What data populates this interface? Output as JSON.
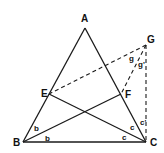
{
  "diagram": {
    "type": "geometry",
    "points": {
      "A": {
        "label": "A",
        "x": 85,
        "y": 28,
        "lx": 81,
        "ly": 22
      },
      "B": {
        "label": "B",
        "x": 23,
        "y": 142,
        "lx": 13,
        "ly": 146
      },
      "C": {
        "label": "C",
        "x": 146,
        "y": 142,
        "lx": 150,
        "ly": 146
      },
      "E": {
        "label": "E",
        "x": 49,
        "y": 94,
        "lx": 41,
        "ly": 97
      },
      "F": {
        "label": "F",
        "x": 121,
        "y": 94,
        "lx": 125,
        "ly": 98
      },
      "G": {
        "label": "G",
        "x": 146,
        "y": 45,
        "lx": 147,
        "ly": 43
      }
    },
    "solid_segments": [
      [
        "A",
        "B"
      ],
      [
        "A",
        "C"
      ],
      [
        "B",
        "C"
      ],
      [
        "B",
        "F"
      ],
      [
        "C",
        "E"
      ]
    ],
    "dashed_segments": [
      [
        "G",
        "E"
      ],
      [
        "G",
        "F"
      ],
      [
        "G",
        "C"
      ]
    ],
    "angle_labels": [
      {
        "text": "b",
        "x": 34,
        "y": 131
      },
      {
        "text": "b",
        "x": 45,
        "y": 141
      },
      {
        "text": "c",
        "x": 130,
        "y": 130
      },
      {
        "text": "c",
        "x": 122,
        "y": 140
      },
      {
        "text": "c'",
        "x": 140,
        "y": 125
      },
      {
        "text": "g",
        "x": 129,
        "y": 61
      },
      {
        "text": "g'",
        "x": 138,
        "y": 67
      }
    ]
  }
}
